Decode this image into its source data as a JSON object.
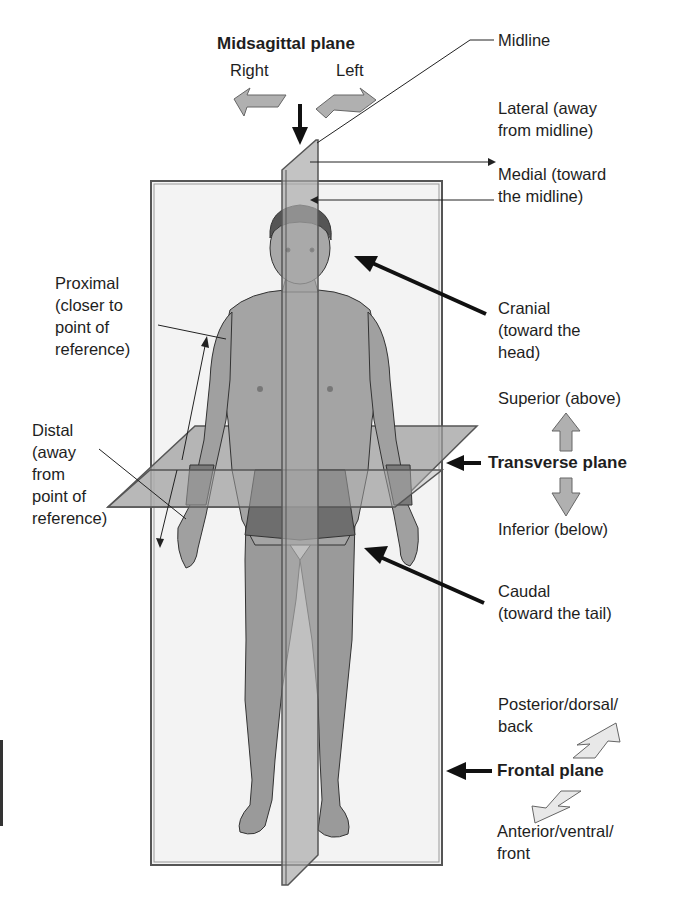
{
  "title": "Midsagittal plane",
  "directions_top": {
    "right": "Right",
    "left": "Left"
  },
  "labels": {
    "midline": "Midline",
    "lateral": [
      "Lateral (away",
      "from midline)"
    ],
    "medial": [
      "Medial (toward",
      "the midline)"
    ],
    "cranial": [
      "Cranial",
      "(toward the",
      "head)"
    ],
    "superior": "Superior (above)",
    "transverse_plane": "Transverse plane",
    "inferior": "Inferior (below)",
    "caudal": [
      "Caudal",
      "(toward the tail)"
    ],
    "posterior": [
      "Posterior/dorsal/",
      "back"
    ],
    "frontal_plane": "Frontal plane",
    "anterior": [
      "Anterior/ventral/",
      "front"
    ],
    "proximal": [
      "Proximal",
      "(closer to",
      "point of",
      "reference)"
    ],
    "distal": [
      "Distal",
      "(away",
      "from",
      "point of",
      "reference)"
    ]
  },
  "colors": {
    "frontal_plane_fill": "#f2f2f2",
    "plane_stroke": "#555555",
    "sagittal_fill": "#a8a8a8",
    "transverse_fill": "#9a9a9a",
    "skin": "#9e9e9e",
    "hair": "#555555",
    "shorts": "#6e6e6e",
    "arrow_fill": "#b5b5b5",
    "arrow_light": "#e6e6e6"
  }
}
